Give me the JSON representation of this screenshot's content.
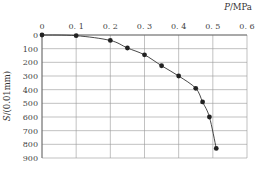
{
  "chart_data": {
    "type": "line",
    "title": "",
    "xlabel": "P/MPa",
    "ylabel": "S/(0.01mm)",
    "x_axis_position": "top",
    "y_axis_inverted": true,
    "xlim": [
      0,
      0.6
    ],
    "ylim": [
      0,
      900
    ],
    "x_ticks": [
      "0",
      "0.1",
      "0.2",
      "0.3",
      "0.4",
      "0.5",
      "0.6"
    ],
    "y_ticks": [
      "0",
      "100",
      "200",
      "300",
      "400",
      "500",
      "600",
      "700",
      "800",
      "900"
    ],
    "grid": true,
    "legend": null,
    "series": [
      {
        "name": "P-S curve",
        "marker": "circle",
        "color": "#222222",
        "x": [
          0,
          0.1,
          0.2,
          0.25,
          0.3,
          0.35,
          0.4,
          0.45,
          0.47,
          0.49,
          0.51
        ],
        "y": [
          0,
          5,
          40,
          95,
          145,
          225,
          300,
          390,
          490,
          600,
          830
        ]
      }
    ]
  }
}
